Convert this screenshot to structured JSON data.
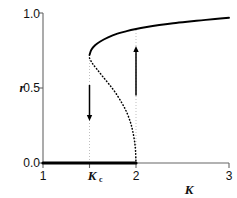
{
  "chart_data": {
    "type": "line",
    "title": "",
    "subtitle": "",
    "xlabel": "K",
    "ylabel": "r",
    "xlim": [
      1,
      3
    ],
    "ylim": [
      0.0,
      1.0
    ],
    "grid": false,
    "legend": "none",
    "x_ticks": [
      {
        "value": 1,
        "label": "1"
      },
      {
        "value": 1.5,
        "label": "Kc"
      },
      {
        "value": 2,
        "label": "2"
      },
      {
        "value": 3,
        "label": "3"
      }
    ],
    "y_ticks": [
      {
        "value": 0.0,
        "label": "0.0"
      },
      {
        "value": 0.5,
        "label": "0.5"
      },
      {
        "value": 1.0,
        "label": "1.0"
      }
    ],
    "series": [
      {
        "name": "stable-zero-branch",
        "style": "solid-thick",
        "color": "#000000",
        "x": [
          1.0,
          1.2,
          1.4,
          1.6,
          1.8,
          2.0
        ],
        "values": [
          0.0,
          0.0,
          0.0,
          0.0,
          0.0,
          0.0
        ]
      },
      {
        "name": "stable-upper-branch",
        "style": "solid",
        "color": "#000000",
        "x": [
          1.5,
          1.52,
          1.56,
          1.62,
          1.7,
          1.8,
          1.9,
          2.0,
          2.1,
          2.25,
          2.4,
          2.55,
          2.7,
          2.85,
          3.0
        ],
        "values": [
          0.72,
          0.755,
          0.785,
          0.812,
          0.838,
          0.862,
          0.879,
          0.893,
          0.905,
          0.92,
          0.932,
          0.942,
          0.951,
          0.96,
          0.968
        ]
      },
      {
        "name": "unstable-branch",
        "style": "dotted",
        "color": "#000000",
        "x": [
          1.5,
          1.53,
          1.58,
          1.64,
          1.71,
          1.78,
          1.85,
          1.9,
          1.94,
          1.965,
          1.985,
          1.995,
          2.0
        ],
        "values": [
          0.7,
          0.665,
          0.625,
          0.578,
          0.525,
          0.468,
          0.398,
          0.338,
          0.272,
          0.212,
          0.142,
          0.078,
          0.0
        ]
      }
    ],
    "guide_lines": [
      {
        "name": "kc-guide",
        "x": 1.5,
        "y_from": 0.0,
        "y_to": 0.72,
        "style": "dotted-faint"
      },
      {
        "name": "k2-guide",
        "x": 2.0,
        "y_from": 0.0,
        "y_to": 0.893,
        "style": "dotted-faint"
      }
    ],
    "annotations": [
      {
        "name": "down-arrow",
        "x": 1.5,
        "y_from": 0.52,
        "y_to": 0.28,
        "direction": "down"
      },
      {
        "name": "up-arrow",
        "x": 2.0,
        "y_from": 0.45,
        "y_to": 0.78,
        "direction": "up"
      }
    ]
  },
  "labels": {
    "y_axis": "r",
    "x_axis": "K",
    "kc_base": "K",
    "kc_sub": "c"
  },
  "colors": {
    "ink": "#111111",
    "curve": "#000000",
    "axis": "#555555",
    "faint": "#b8b8b8"
  }
}
